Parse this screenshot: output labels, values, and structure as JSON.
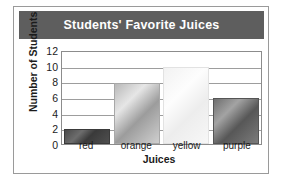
{
  "chart_data": {
    "type": "bar",
    "title": "Students' Favorite Juices",
    "xlabel": "Juices",
    "ylabel": "Number of Students",
    "categories": [
      "red",
      "orange",
      "yellow",
      "purple"
    ],
    "values": [
      2,
      8,
      10,
      6
    ],
    "yticks": [
      0,
      2,
      4,
      6,
      8,
      10,
      12
    ],
    "ylim": [
      0,
      12
    ],
    "grid": true,
    "legend": "none",
    "series": [
      {
        "name": "Number of Students",
        "values": [
          2,
          8,
          10,
          6
        ]
      }
    ],
    "bar_styles": [
      {
        "category": "red",
        "fill": "#4a4a4a"
      },
      {
        "category": "orange",
        "fill": "#b9b9b9"
      },
      {
        "category": "yellow",
        "fill": "#f2f2f2"
      },
      {
        "category": "purple",
        "fill": "#6f6f6f"
      }
    ],
    "colors": {
      "title_banner_bg": "#5e5e5e",
      "title_text": "#ffffff",
      "frame_border": "#9a9a9a",
      "plot_border": "#8c8c8c",
      "gridline": "#9d9d9d",
      "axis_text": "#1b1b1b",
      "background": "#ffffff"
    }
  }
}
